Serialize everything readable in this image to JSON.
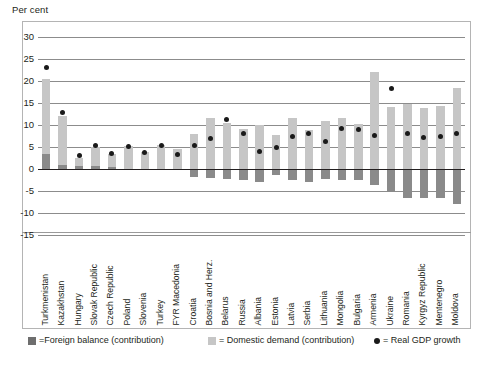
{
  "axis_title": "Per cent",
  "legend": [
    {
      "name": "foreign-balance",
      "marker": "square-dark",
      "label": "=Foreign balance (contribution)",
      "color": "#6e6e6e"
    },
    {
      "name": "domestic-demand",
      "marker": "square-light",
      "label": "= Domestic demand (contribution)",
      "color": "#c6c6c6"
    },
    {
      "name": "real-gdp-growth",
      "marker": "dot",
      "label": "= Real GDP growth",
      "color": "#1a1a1a"
    }
  ],
  "chart_data": {
    "type": "bar",
    "title": "",
    "subtitle": "",
    "xlabel": "",
    "ylabel": "Per cent",
    "ylim": [
      -15,
      30
    ],
    "yticks": [
      30,
      25,
      20,
      15,
      10,
      5,
      0,
      -5,
      -10,
      -15
    ],
    "grid": true,
    "stacked": true,
    "legend_position": "bottom",
    "categories": [
      "Turkmenistan",
      "Kazakhstan",
      "Hungary",
      "Slovak Republic",
      "Czech Republic",
      "Poland",
      "Slovenia",
      "Turkey",
      "FYR Macedonia",
      "Croatia",
      "Bosnia and Herz.",
      "Belarus",
      "Russia",
      "Albania",
      "Estonia",
      "Latvia",
      "Serbia",
      "Lithuania",
      "Mongolia",
      "Bulgaria",
      "Armenia",
      "Ukraine",
      "Romania",
      "Kyrgyz Republic",
      "Mentenegro",
      "Moldova"
    ],
    "series": [
      {
        "name": "Foreign balance (contribution)",
        "color": "#8a8a8a",
        "values": [
          3.5,
          1.0,
          0.7,
          0.6,
          0.5,
          0.0,
          0.0,
          0.0,
          0.0,
          -1.8,
          -2.0,
          -2.3,
          -2.6,
          -3.0,
          -1.4,
          -2.4,
          -3.0,
          -2.3,
          -2.4,
          -2.4,
          -3.6,
          -5.2,
          -6.6,
          -6.6,
          -6.6,
          -8.0
        ]
      },
      {
        "name": "Domestic demand (contribution)",
        "color": "#c6c6c6",
        "values": [
          20.5,
          12.0,
          2.6,
          4.9,
          3.3,
          5.2,
          3.9,
          5.4,
          4.5,
          8.0,
          11.5,
          10.5,
          9.0,
          9.9,
          7.7,
          11.5,
          8.8,
          11.0,
          11.7,
          10.3,
          22.0,
          14.2,
          14.8,
          13.8,
          14.3,
          18.5
        ]
      }
    ],
    "points": {
      "name": "Real GDP growth",
      "color": "#1a1a1a",
      "values": [
        23.0,
        12.8,
        3.0,
        5.4,
        3.6,
        5.2,
        3.8,
        5.4,
        3.4,
        5.4,
        7.0,
        11.3,
        8.1,
        4.0,
        5.0,
        7.3,
        8.1,
        6.2,
        9.3,
        9.0,
        7.7,
        18.3,
        8.0,
        7.2,
        7.4,
        8.1
      ]
    }
  }
}
